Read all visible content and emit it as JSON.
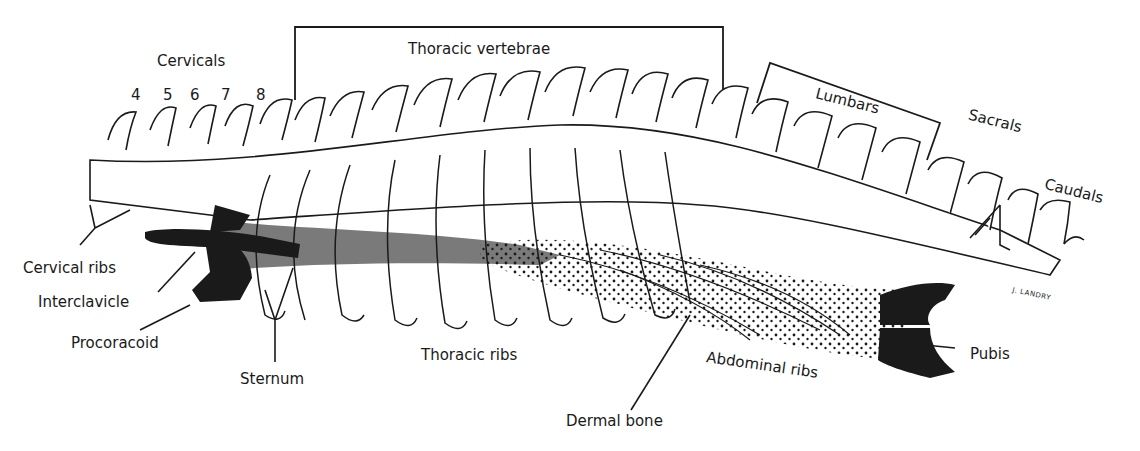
{
  "figure": {
    "colors": {
      "line": "#1a1a1a",
      "black_fill": "#1a1a1a",
      "gray_fill": "#7a7a7a",
      "background": "#ffffff"
    }
  },
  "labels": {
    "cervicals": "Cervicals",
    "cervical_numbers": [
      "4",
      "5",
      "6",
      "7",
      "8"
    ],
    "thoracic_vertebrae": "Thoracic vertebrae",
    "lumbars": "Lumbars",
    "sacrals": "Sacrals",
    "caudals": "Caudals",
    "cervical_ribs": "Cervical ribs",
    "interclavicle": "Interclavicle",
    "procoracoid": "Procoracoid",
    "sternum": "Sternum",
    "thoracic_ribs": "Thoracic ribs",
    "dermal_bone": "Dermal bone",
    "abdominal_ribs": "Abdominal ribs",
    "pubis": "Pubis",
    "signature": "J. LANDRY"
  }
}
